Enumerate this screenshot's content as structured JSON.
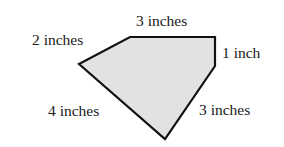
{
  "figure": {
    "shape": "pentagon",
    "fill_color": "#e2e2e2",
    "stroke_color": "#111111",
    "vertices": [
      [
        130,
        37
      ],
      [
        215,
        37
      ],
      [
        215,
        66
      ],
      [
        165,
        139
      ],
      [
        79,
        64
      ]
    ],
    "labels": {
      "top": "3 inches",
      "upper_left": "2 inches",
      "right": "1 inch",
      "lower_left": "4 inches",
      "lower_right": "3 inches"
    }
  }
}
